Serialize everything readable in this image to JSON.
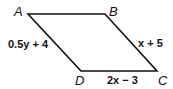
{
  "figure": {
    "shape": "parallelogram",
    "vertices": [
      {
        "label": "A",
        "x": 28,
        "y": 14
      },
      {
        "label": "B",
        "x": 105,
        "y": 14
      },
      {
        "label": "C",
        "x": 157,
        "y": 71
      },
      {
        "label": "D",
        "x": 81,
        "y": 71
      }
    ],
    "side_labels": {
      "AD": "0.5y + 4",
      "BC": "x + 5",
      "DC": "2x − 3"
    },
    "stroke_color": "#111111"
  }
}
